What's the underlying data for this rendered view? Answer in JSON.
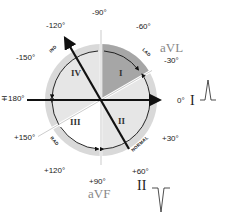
{
  "diagram": {
    "angles": {
      "minus90": "-90°",
      "minus60": "-60°",
      "minus30": "-30°",
      "zero": "0°",
      "plus30": "+30°",
      "plus60": "+60°",
      "plus90": "+90°",
      "plus120": "+120°",
      "plus150": "+150°",
      "plus180": "∓180°",
      "minus150": "-150°",
      "minus120": "-120°"
    },
    "quadrants": {
      "q1": "I",
      "q2": "II",
      "q3": "III",
      "q4": "IV"
    },
    "arc_labels": {
      "lad": "LAD",
      "normal": "NORMAL",
      "rad": "RAD",
      "ind": "IND"
    },
    "leads": {
      "avl": "aVL",
      "avf": "aVF",
      "lead1": "I",
      "lead2": "II"
    },
    "waveforms": {
      "lead1": "upright",
      "lead2": "inverted"
    },
    "colors": {
      "outer_ring": "#d9d9d9",
      "lad_sector": "#a6a6a6",
      "inner_disk": "#e6e6e6",
      "lines": "#111111",
      "lead_label": "#8a8a8a"
    }
  }
}
